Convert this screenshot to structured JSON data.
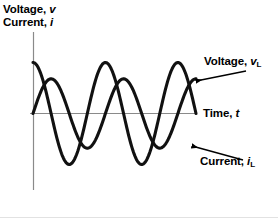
{
  "figure": {
    "title": "",
    "background_color": "#ffffff",
    "curve_color": "#111111",
    "axis_color": "#7a7a7a",
    "arrow_color": "#000000"
  },
  "labels": {
    "y_axis_line1_prefix": "Voltage, ",
    "y_axis_line1_symbol": "v",
    "y_axis_line2_prefix": "Current, ",
    "y_axis_line2_symbol": "i",
    "voltage_prefix": "Voltage, ",
    "voltage_symbol": "v",
    "voltage_subscript": "L",
    "time_prefix": "Time, ",
    "time_symbol": "t",
    "current_prefix": "Current, ",
    "current_symbol": "i",
    "current_subscript": "L"
  },
  "chart_data": {
    "type": "line",
    "title": "",
    "xlabel": "Time, t",
    "ylabel": "Voltage, v / Current, i",
    "xlim": [
      0,
      2.25
    ],
    "ylim": [
      -1.15,
      1.15
    ],
    "grid": false,
    "legend": "annotations",
    "x_unit": "periods",
    "series": [
      {
        "name": "Voltage, vL",
        "waveform": "cosine",
        "amplitude": 1.0,
        "phase_deg": 0,
        "periods": 2.25,
        "description": "Voltage leads current by 90 degrees; starts at positive peak"
      },
      {
        "name": "Current, iL",
        "waveform": "sine",
        "amplitude": 0.68,
        "phase_deg": -90,
        "periods": 2.25,
        "description": "Current lags voltage by 90 degrees; starts at zero rising"
      }
    ],
    "annotations": [
      {
        "text": "Voltage, vL",
        "points_to": "voltage-curve",
        "position": "upper-right"
      },
      {
        "text": "Time, t",
        "points_to": "x-axis",
        "position": "middle-right"
      },
      {
        "text": "Current, iL",
        "points_to": "current-curve",
        "position": "lower-right"
      }
    ]
  }
}
